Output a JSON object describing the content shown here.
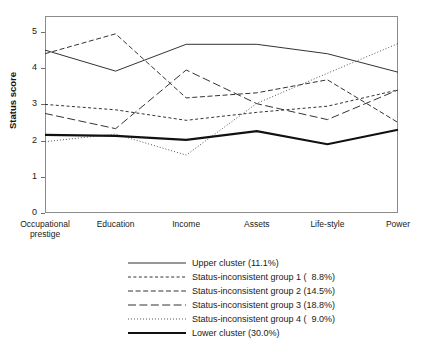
{
  "chart_data": {
    "type": "line",
    "title": "",
    "xlabel": "",
    "ylabel": "Status score",
    "ylim": [
      0,
      5.45
    ],
    "yticks": [
      0,
      1,
      2,
      3,
      4,
      5
    ],
    "grid": false,
    "legend_position": "bottom",
    "categories": [
      "Occupational\nprestige",
      "Education",
      "Income",
      "Assets",
      "Life-style",
      "Power"
    ],
    "categories_flat": [
      "Occupational prestige",
      "Education",
      "Income",
      "Assets",
      "Life-style",
      "Power"
    ],
    "series": [
      {
        "name": "Upper cluster (11.1%)",
        "group": "Upper cluster",
        "percent": "11.1%",
        "style": "solid",
        "width": 1,
        "color": "#333333",
        "values": [
          4.5,
          3.92,
          4.66,
          4.66,
          4.4,
          3.89
        ]
      },
      {
        "name": "Status-inconsistent group 1 (  8.8%)",
        "group": "Status-inconsistent group 1",
        "percent": "8.8%",
        "style": "short-dash",
        "width": 1,
        "color": "#333333",
        "values": [
          3.0,
          2.85,
          2.56,
          2.78,
          2.95,
          3.4
        ]
      },
      {
        "name": "Status-inconsistent group 2 (14.5%)",
        "group": "Status-inconsistent group 2",
        "percent": "14.5%",
        "style": "medium-dash",
        "width": 1,
        "color": "#333333",
        "values": [
          4.4,
          4.95,
          3.18,
          3.32,
          3.68,
          2.5
        ]
      },
      {
        "name": "Status-inconsistent group 3 (18.8%)",
        "group": "Status-inconsistent group 3",
        "percent": "18.8%",
        "style": "long-dash",
        "width": 1,
        "color": "#333333",
        "values": [
          2.75,
          2.33,
          3.95,
          3.02,
          2.58,
          3.4
        ]
      },
      {
        "name": "Status-inconsistent group 4 (  9.0%)",
        "group": "Status-inconsistent group 4",
        "percent": "9.0%",
        "style": "dotted",
        "width": 1,
        "color": "#555555",
        "values": [
          1.97,
          2.18,
          1.6,
          3.03,
          3.86,
          4.68
        ]
      },
      {
        "name": "Lower cluster (30.0%)",
        "group": "Lower cluster",
        "percent": "30.0%",
        "style": "solid",
        "width": 2.2,
        "color": "#111111",
        "values": [
          2.16,
          2.13,
          2.02,
          2.26,
          1.9,
          2.3
        ]
      }
    ]
  },
  "axis": {
    "y_title": "Status score",
    "yticks": [
      "5",
      "4",
      "3",
      "2",
      "1",
      "0"
    ],
    "xticks": [
      "Occupational\nprestige",
      "Education",
      "Income",
      "Assets",
      "Life-style",
      "Power"
    ]
  },
  "legend": {
    "items": [
      {
        "label": "Upper cluster (11.1%)",
        "style": "solid"
      },
      {
        "label": "Status-inconsistent group 1 (  8.8%)",
        "style": "short-dash"
      },
      {
        "label": "Status-inconsistent group 2 (14.5%)",
        "style": "medium-dash"
      },
      {
        "label": "Status-inconsistent group 3 (18.8%)",
        "style": "long-dash"
      },
      {
        "label": "Status-inconsistent group 4 (  9.0%)",
        "style": "dotted"
      },
      {
        "label": "Lower cluster (30.0%)",
        "style": "solid-thick"
      }
    ]
  }
}
